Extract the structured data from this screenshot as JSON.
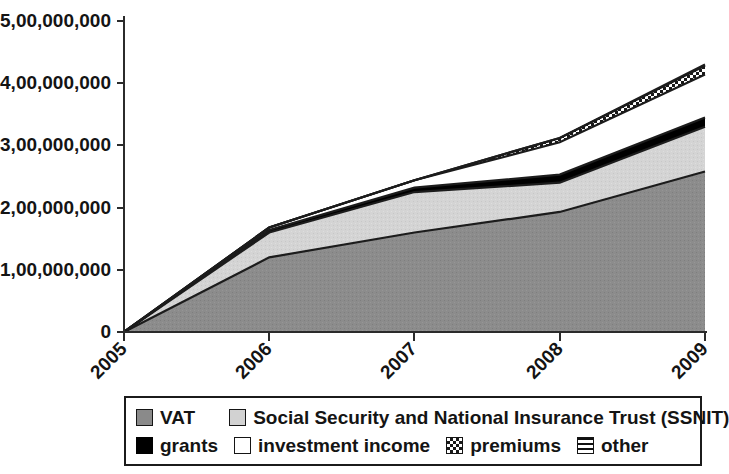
{
  "chart_data": {
    "type": "area",
    "title": "",
    "xlabel": "",
    "ylabel": "",
    "stacked": true,
    "grid": false,
    "legend_position": "bottom",
    "x": [
      2005,
      2006,
      2007,
      2008,
      2009
    ],
    "categories": [
      "2005",
      "2006",
      "2007",
      "2008",
      "2009"
    ],
    "xtick_labels": [
      "2005",
      "2006",
      "2007",
      "2008",
      "2009"
    ],
    "ytick_labels": [
      "0",
      "1,00,000,000",
      "2,00,000,000",
      "3,00,000,000",
      "4,00,000,000",
      "5,00,000,000"
    ],
    "ytick_values": [
      0,
      100000000,
      200000000,
      300000000,
      400000000,
      500000000
    ],
    "ylim": [
      0,
      500000000
    ],
    "xlim": [
      2005,
      2009
    ],
    "series": [
      {
        "name": "VAT",
        "key": "vat",
        "values": [
          0,
          120000000,
          160000000,
          193000000,
          258000000
        ]
      },
      {
        "name": "Social Security and National Insurance Trust (SSNIT)",
        "key": "ssnit",
        "values": [
          0,
          40000000,
          65000000,
          47000000,
          72000000
        ]
      },
      {
        "name": "grants",
        "key": "grants",
        "values": [
          0,
          4000000,
          7000000,
          13000000,
          15000000
        ]
      },
      {
        "name": "investment income",
        "key": "invest",
        "values": [
          0,
          4000000,
          12000000,
          52000000,
          69000000
        ]
      },
      {
        "name": "premiums",
        "key": "prem",
        "values": [
          0,
          0,
          0,
          7000000,
          14000000
        ]
      },
      {
        "name": "other",
        "key": "other",
        "values": [
          0,
          0,
          0,
          0,
          2000000
        ]
      }
    ],
    "cumulative_totals": [
      0,
      168000000,
      244000000,
      312000000,
      430000000
    ]
  },
  "legend": {
    "row1": [
      {
        "label": "VAT",
        "swatch": "vat-swatch",
        "color": "#8a8a8a"
      },
      {
        "label": "Social Security and National Insurance Trust (SSNIT)",
        "swatch": "ssnit-swatch",
        "color": "#d2d2d2"
      }
    ],
    "row2": [
      {
        "label": "grants",
        "swatch": "grants-swatch",
        "color": "#000000"
      },
      {
        "label": "investment income",
        "swatch": "investment-income-swatch",
        "color": "#ffffff"
      },
      {
        "label": "premiums",
        "swatch": "premiums-swatch",
        "color": "#ffffff"
      },
      {
        "label": "other",
        "swatch": "other-swatch",
        "color": "#ffffff"
      }
    ]
  },
  "axes": {
    "y_ticks": [
      {
        "label": "5,00,000,000",
        "y": 21
      },
      {
        "label": "4,00,000,000",
        "y": 83
      },
      {
        "label": "3,00,000,000",
        "y": 145
      },
      {
        "label": "2,00,000,000",
        "y": 208
      },
      {
        "label": "1,00,000,000",
        "y": 270
      },
      {
        "label": "0",
        "y": 332
      }
    ],
    "x_ticks": [
      {
        "label": "2005",
        "x": 124
      },
      {
        "label": "2006",
        "x": 269
      },
      {
        "label": "2007",
        "x": 414
      },
      {
        "label": "2008",
        "x": 560
      },
      {
        "label": "2009",
        "x": 705
      }
    ]
  }
}
